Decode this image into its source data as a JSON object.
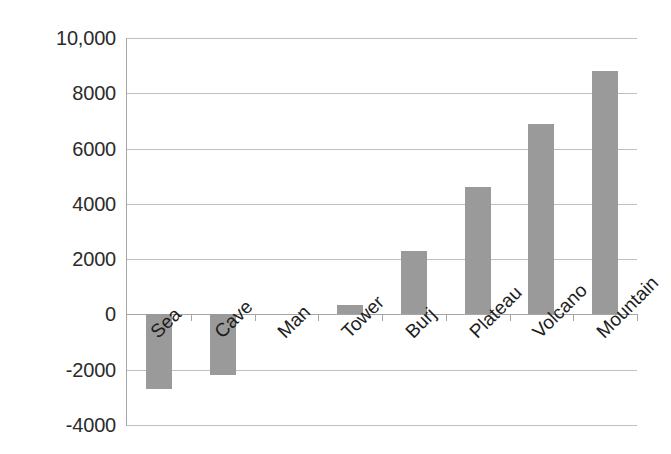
{
  "chart_data": {
    "type": "bar",
    "title": "",
    "subtitle": "",
    "xlabel": "",
    "ylabel": "",
    "categories": [
      "Sea",
      "Cave",
      "Man",
      "Tower",
      "Burj",
      "Plateau",
      "Volcano",
      "Mountain"
    ],
    "values": [
      -2700,
      -2200,
      0,
      330,
      2300,
      4600,
      6900,
      8800
    ],
    "series": [
      {
        "name": "",
        "values": [
          -2700,
          -2200,
          0,
          330,
          2300,
          4600,
          6900,
          8800
        ]
      }
    ],
    "ylim": [
      -4000,
      10000
    ],
    "ytick_values": [
      10000,
      8000,
      6000,
      4000,
      2000,
      0,
      -2000,
      -4000
    ],
    "ytick_labels": [
      "10,000",
      "8000",
      "6000",
      "4000",
      "2000",
      "0",
      "-2000",
      "-4000"
    ],
    "grid": true,
    "legend": false,
    "legend_position": "none",
    "bar_color": "#9a9a9a",
    "gridline_color": "#bfbfbf",
    "axis_color": "#a6a6a6",
    "background_color": "#ffffff",
    "label_rotation": -45
  }
}
